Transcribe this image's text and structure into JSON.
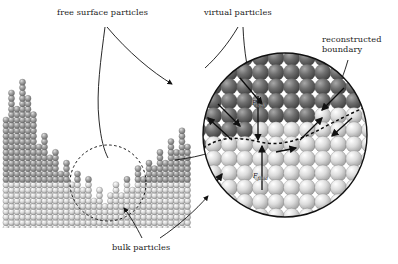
{
  "figure": {
    "type": "sph-particle-simulation-diagram",
    "background_color": "#ffffff",
    "width": 398,
    "height": 264
  },
  "labels": {
    "free_surface": "free surface particles",
    "virtual": "virtual particles",
    "reconstructed_line1": "reconstructed",
    "reconstructed_line2": "boundary",
    "bulk": "bulk particles"
  },
  "inset": {
    "force_wall": "F",
    "force_wall_sub": "wall",
    "force_fluid": "F",
    "force_fluid_sub": "fluid"
  },
  "colors": {
    "particle_dark": "#6f6f6f",
    "particle_mid": "#9a9a9a",
    "particle_light": "#d8d8d8",
    "particle_highlight": "#f2f2f2",
    "line": "#111111",
    "text": "#1b1b1b"
  },
  "chart_data": {
    "type": "scatter",
    "title": "",
    "xlabel": "",
    "ylabel": "",
    "regions": [
      {
        "name": "free-surface-particles",
        "shade": "mid",
        "note": "upper jagged column tips"
      },
      {
        "name": "bulk-particles",
        "shade": "light",
        "note": "dense lower lattice"
      },
      {
        "name": "virtual-particles",
        "shade": "dark",
        "note": "inset upper half"
      },
      {
        "name": "reconstructed-boundary",
        "shade": "dashed",
        "note": "inset mid dashed curve"
      }
    ],
    "surface_column_heights": [
      42,
      52,
      47,
      57,
      50,
      44,
      33,
      36,
      28,
      30,
      22,
      26,
      18,
      21,
      15,
      19,
      12,
      16,
      10,
      14,
      17,
      13,
      20,
      16,
      24,
      19,
      27,
      23,
      31,
      26,
      34,
      30,
      38,
      33
    ],
    "grid": false,
    "legend_position": "none"
  }
}
